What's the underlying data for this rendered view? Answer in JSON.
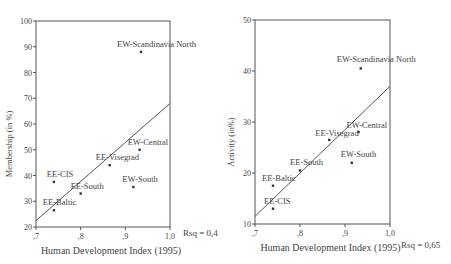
{
  "chart_data": [
    {
      "type": "scatter",
      "title": "",
      "xlabel": "Human Development Index (1995)",
      "ylabel": "Membership (in %)",
      "xlim": [
        0.7,
        1.0
      ],
      "ylim": [
        20,
        100
      ],
      "xticks": [
        ",7",
        ",8",
        ",9",
        "1,0"
      ],
      "yticks": [
        "20",
        "30",
        "40",
        "50",
        "60",
        "70",
        "80",
        "90",
        "100"
      ],
      "grid": false,
      "points": [
        {
          "label": "EW-Scandinavia North",
          "x": 0.935,
          "y": 88
        },
        {
          "label": "EW-Central",
          "x": 0.932,
          "y": 50
        },
        {
          "label": "EE-Visegrad",
          "x": 0.865,
          "y": 44
        },
        {
          "label": "EW-South",
          "x": 0.918,
          "y": 35.5
        },
        {
          "label": "EE-CIS",
          "x": 0.74,
          "y": 37.5
        },
        {
          "label": "EE-South",
          "x": 0.8,
          "y": 33
        },
        {
          "label": "EE-Baltic",
          "x": 0.74,
          "y": 26.5
        }
      ],
      "fit_line": {
        "x": [
          0.7,
          1.0
        ],
        "y": [
          22.5,
          68
        ]
      },
      "annotation": "Rsq = 0,4"
    },
    {
      "type": "scatter",
      "title": "",
      "xlabel": "Human Development Index (1995)",
      "ylabel": "Activity (in%)",
      "xlim": [
        0.7,
        1.0
      ],
      "ylim": [
        10,
        50
      ],
      "xticks": [
        ",7",
        ",8",
        ",9",
        "1,0"
      ],
      "yticks": [
        "10",
        "20",
        "30",
        "40",
        "50"
      ],
      "grid": false,
      "points": [
        {
          "label": "EW-Scandinavia North",
          "x": 0.935,
          "y": 40.5
        },
        {
          "label": "EW-Central",
          "x": 0.93,
          "y": 28
        },
        {
          "label": "EE-Visegrad",
          "x": 0.865,
          "y": 26.5
        },
        {
          "label": "EW-South",
          "x": 0.915,
          "y": 22
        },
        {
          "label": "EE-South",
          "x": 0.8,
          "y": 20.5
        },
        {
          "label": "EE-Baltic",
          "x": 0.74,
          "y": 17.5
        },
        {
          "label": "EE-CIS",
          "x": 0.74,
          "y": 13
        }
      ],
      "fit_line": {
        "x": [
          0.7,
          1.0
        ],
        "y": [
          11.5,
          37
        ]
      },
      "annotation": "Rsq = 0,65"
    }
  ]
}
